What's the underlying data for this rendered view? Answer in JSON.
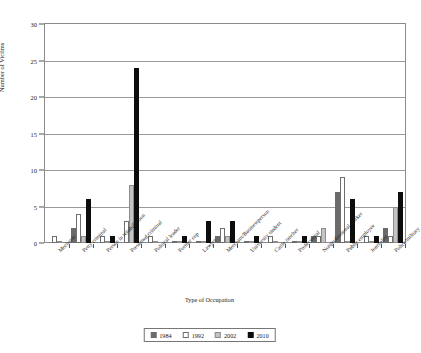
{
  "chart_data": {
    "type": "bar",
    "title": "",
    "xlabel": "Type of Occupation",
    "ylabel": "Number of Victims",
    "ylim": [
      0,
      30
    ],
    "yticks": [
      0,
      5,
      10,
      15,
      20,
      25,
      30
    ],
    "grid": true,
    "legend_position": "bottom",
    "categories": [
      "Mechanic",
      "Petty criminal",
      "Person in rehabilitation",
      "Presumed criminal",
      "Political leader",
      "Former cop",
      "Lawyer",
      "Merchant/Businessperson",
      "University student",
      "Cattle rancher",
      "Professional",
      "Nonprofessional worker",
      "Public employee",
      "Journalist",
      "Police/military"
    ],
    "series": [
      {
        "name": "1984",
        "color": "#6b6b6b",
        "values": [
          0,
          2,
          0,
          0,
          0,
          0,
          0,
          1,
          0,
          0,
          0,
          1,
          7,
          0,
          2
        ]
      },
      {
        "name": "1992",
        "color": "#ffffff",
        "values": [
          1,
          4,
          1,
          3,
          1,
          0,
          0,
          2,
          0,
          1,
          0,
          1,
          9,
          1,
          1
        ]
      },
      {
        "name": "2002",
        "color": "#c4c4c4",
        "values": [
          0,
          1,
          0,
          8,
          0,
          0,
          0,
          1,
          0,
          0,
          0,
          2,
          0,
          0,
          5
        ]
      },
      {
        "name": "2010",
        "color": "#0d0d0d",
        "values": [
          0,
          6,
          1,
          24,
          0,
          1,
          3,
          3,
          1,
          0,
          1,
          0,
          6,
          1,
          7
        ]
      }
    ]
  },
  "legend": {
    "items": [
      {
        "label": "1984"
      },
      {
        "label": "1992"
      },
      {
        "label": "2002"
      },
      {
        "label": "2010"
      }
    ]
  }
}
